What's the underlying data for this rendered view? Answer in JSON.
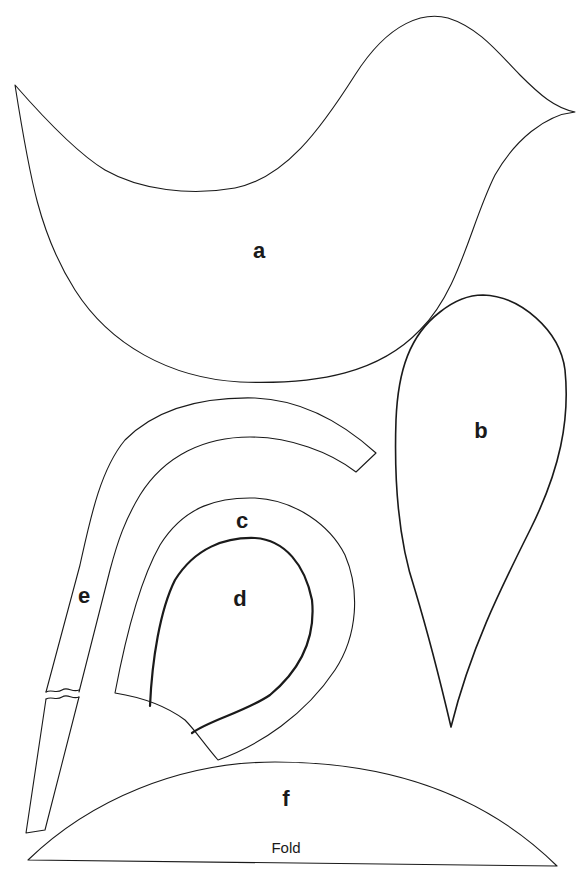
{
  "pattern": {
    "stroke_color": "#1a1a1a",
    "background_color": "#ffffff",
    "pieces": [
      {
        "id": "a",
        "label": "a",
        "description": "bird body"
      },
      {
        "id": "b",
        "label": "b",
        "description": "wing teardrop"
      },
      {
        "id": "c",
        "label": "c",
        "description": "curved band"
      },
      {
        "id": "d",
        "label": "d",
        "description": "inner teardrop"
      },
      {
        "id": "e",
        "label": "e",
        "description": "long curved strip with break mark"
      },
      {
        "id": "f",
        "label": "f",
        "description": "arched base on fold"
      }
    ],
    "fold_label": "Fold"
  }
}
